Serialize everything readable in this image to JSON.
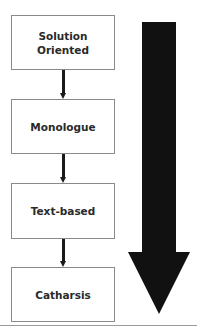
{
  "diagram": {
    "steps": [
      {
        "label_line1": "Solution",
        "label_line2": "Oriented"
      },
      {
        "label": "Monologue"
      },
      {
        "label": "Text-based"
      },
      {
        "label": "Catharsis"
      }
    ],
    "big_arrow": {
      "direction": "down",
      "color": "#111111"
    },
    "connector_color": "#1a1a1a",
    "box_border_color": "#8a8a8a"
  }
}
